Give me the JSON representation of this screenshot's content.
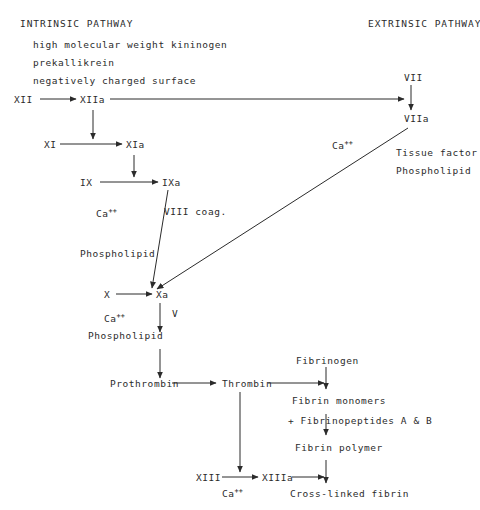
{
  "diagram": {
    "title_intrinsic": "INTRINSIC PATHWAY",
    "title_extrinsic": "EXTRINSIC PATHWAY",
    "cofactors_intrinsic": [
      "high molecular weight kininogen",
      "prekallikrein",
      "negatively charged surface"
    ],
    "nodes": {
      "xii": "XII",
      "xiia": "XIIa",
      "xi": "XI",
      "xia": "XIa",
      "ix": "IX",
      "ixa": "IXa",
      "x_left": "X",
      "xa": "Xa",
      "vii": "VII",
      "viia": "VIIa",
      "prothrombin": "Prothrombin",
      "thrombin": "Thrombin",
      "xiii": "XIII",
      "xiiia": "XIIIa",
      "fibrinogen": "Fibrinogen",
      "fibrin_monomers": "Fibrin monomers",
      "fibrinopeptides": "+ Fibrinopeptides A & B",
      "fibrin_polymer": "Fibrin polymer",
      "crosslinked_fibrin": "Cross-linked fibrin"
    },
    "cofactor_labels": {
      "ca_base": "Ca",
      "ca_sup": "++",
      "viii_coag": "VIII coag.",
      "phospholipid": "Phospholipid",
      "factor_v": "V",
      "tissue_factor": "Tissue factor"
    },
    "colors": {
      "ink": "#2b2b2b",
      "background": "#ffffff"
    }
  }
}
